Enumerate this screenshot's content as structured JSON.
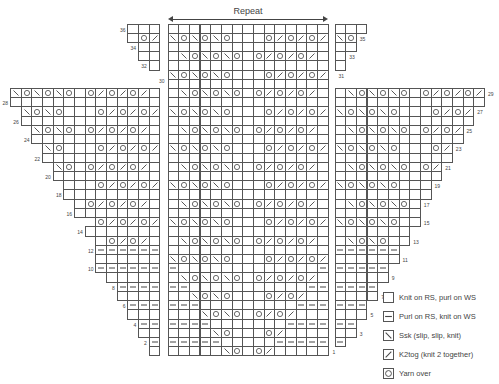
{
  "repeat": {
    "label": "Repeat"
  },
  "symbols_key": {
    ".": "knit",
    "-": "purl",
    "\\": "ssk",
    "/": "k2tog",
    "o": "yarn-over"
  },
  "center_chart": {
    "stitches": 15,
    "rows": [
      {
        "n": 36,
        "s": "..............."
      },
      {
        "n": 35,
        "s": "\\o\\o\\o...o/o/o/"
      },
      {
        "n": 34,
        "s": "..............."
      },
      {
        "n": 33,
        "s": ".\\o\\o\\o.o/o/o/."
      },
      {
        "n": 32,
        "s": "..............."
      },
      {
        "n": 31,
        "s": "\\o\\o\\o...o/o/o/"
      },
      {
        "n": 30,
        "s": "..............."
      },
      {
        "n": 29,
        "s": ".\\o\\o\\o.o/o/o/."
      },
      {
        "n": 28,
        "s": "..............."
      },
      {
        "n": 27,
        "s": "\\o\\o\\o...o/o/o/"
      },
      {
        "n": 26,
        "s": "..............."
      },
      {
        "n": 25,
        "s": ".\\o\\o\\o.o/o/o/."
      },
      {
        "n": 24,
        "s": "..............."
      },
      {
        "n": 23,
        "s": "\\o\\o\\o...o/o/o/"
      },
      {
        "n": 22,
        "s": "..............."
      },
      {
        "n": 21,
        "s": ".\\o\\o\\o.o/o/o/."
      },
      {
        "n": 20,
        "s": "..............."
      },
      {
        "n": 19,
        "s": "\\o\\o\\o...o/o/o/"
      },
      {
        "n": 18,
        "s": "..............."
      },
      {
        "n": 17,
        "s": ".\\o\\o\\o.o/o/o/."
      },
      {
        "n": 16,
        "s": "..............."
      },
      {
        "n": 15,
        "s": "\\o\\o\\o...o/o/o/"
      },
      {
        "n": 14,
        "s": "..............."
      },
      {
        "n": 13,
        "s": ".\\o\\o\\o.o/o/o/."
      },
      {
        "n": 12,
        "s": "..............."
      },
      {
        "n": 11,
        "s": "\\o\\o\\o...o/o/o/"
      },
      {
        "n": 10,
        "s": "-.............-"
      },
      {
        "n": 9,
        "s": ".\\o\\o\\o.o/o/o/."
      },
      {
        "n": 8,
        "s": "--...........--"
      },
      {
        "n": 7,
        "s": "..\\o\\o...o/o/.."
      },
      {
        "n": 6,
        "s": "---.........---"
      },
      {
        "n": 5,
        "s": "...\\o\\o.o/o/..."
      },
      {
        "n": 4,
        "s": "----.......----"
      },
      {
        "n": 3,
        "s": "....\\o...o/...."
      },
      {
        "n": 2,
        "s": "-----.....-----"
      },
      {
        "n": 1,
        "s": ".....\\o.o/....."
      }
    ],
    "labels": [
      {
        "n": 30,
        "side": "left"
      },
      {
        "n": 1,
        "side": "right"
      }
    ]
  },
  "left_chart": {
    "rows": [
      {
        "n": 36,
        "s": "...",
        "label": "36"
      },
      {
        "n": 35,
        "s": ".o/",
        "label": ""
      },
      {
        "n": 34,
        "s": "..",
        "label": "34"
      },
      {
        "n": 33,
        "s": "..",
        "label": ""
      },
      {
        "n": 32,
        "s": ".",
        "label": "32"
      },
      {
        "n": 29,
        "s": "\\o\\o\\o.o/o/o/.",
        "label": ""
      },
      {
        "n": 28,
        "s": "..............",
        "label": "28"
      },
      {
        "n": 27,
        "s": "\\o\\o...o/o/o/",
        "label": ""
      },
      {
        "n": 26,
        "s": ".............",
        "label": "26"
      },
      {
        "n": 25,
        "s": "\\o\\o.o/o/o/.",
        "label": ""
      },
      {
        "n": 24,
        "s": "............",
        "label": "24"
      },
      {
        "n": 23,
        "s": "\\o...o/o/o/",
        "label": ""
      },
      {
        "n": 22,
        "s": "...........",
        "label": "22"
      },
      {
        "n": 21,
        "s": "\\o.o/o/o/.",
        "label": ""
      },
      {
        "n": 20,
        "s": "..........",
        "label": "20"
      },
      {
        "n": 19,
        "s": "...o/o/o/",
        "label": ""
      },
      {
        "n": 18,
        "s": ".........",
        "label": "18"
      },
      {
        "n": 17,
        "s": ".o/o/o/.",
        "label": ""
      },
      {
        "n": 16,
        "s": "........",
        "label": "16"
      },
      {
        "n": 15,
        "s": "o/o/o/",
        "label": ""
      },
      {
        "n": 14,
        "s": ".......",
        "label": "14"
      },
      {
        "n": 13,
        "s": ".o/o/.",
        "label": ""
      },
      {
        "n": 12,
        "s": "------",
        "label": "12"
      },
      {
        "n": 11,
        "s": "......",
        "label": ""
      },
      {
        "n": 10,
        "s": "------",
        "label": "10"
      },
      {
        "n": 9,
        "s": ".....",
        "label": ""
      },
      {
        "n": 8,
        "s": "----",
        "label": "8"
      },
      {
        "n": 7,
        "s": "....",
        "label": ""
      },
      {
        "n": 6,
        "s": "---",
        "label": "6"
      },
      {
        "n": 5,
        "s": "...",
        "label": ""
      },
      {
        "n": 4,
        "s": "--",
        "label": "4"
      },
      {
        "n": 3,
        "s": "..",
        "label": ""
      },
      {
        "n": 2,
        "s": "-",
        "label": "2"
      },
      {
        "n": 1,
        "s": ".",
        "label": ""
      }
    ]
  },
  "right_chart": {
    "rows": [
      {
        "n": 36,
        "s": "...",
        "label": ""
      },
      {
        "n": 35,
        "s": "\\o",
        "label": "35"
      },
      {
        "n": 34,
        "s": "..",
        "label": ""
      },
      {
        "n": 33,
        "s": ".",
        "label": "33"
      },
      {
        "n": 32,
        "s": ".",
        "label": ""
      },
      {
        "n": 31,
        "s": "",
        "label": "31"
      },
      {
        "n": 29,
        "s": ".\\o\\o\\o.o/o/o/",
        "label": "29"
      },
      {
        "n": 28,
        "s": "..............",
        "label": ""
      },
      {
        "n": 27,
        "s": "\\o\\o\\o...o/o/",
        "label": "27"
      },
      {
        "n": 26,
        "s": ".............",
        "label": ""
      },
      {
        "n": 25,
        "s": ".\\o\\o\\o.o/o/",
        "label": "25"
      },
      {
        "n": 24,
        "s": "............",
        "label": ""
      },
      {
        "n": 23,
        "s": "\\o\\o\\o...o/",
        "label": "23"
      },
      {
        "n": 22,
        "s": "...........",
        "label": ""
      },
      {
        "n": 21,
        "s": ".\\o\\o\\o.o/",
        "label": "21"
      },
      {
        "n": 20,
        "s": "..........",
        "label": ""
      },
      {
        "n": 19,
        "s": "\\o\\o\\o...",
        "label": "19"
      },
      {
        "n": 18,
        "s": ".........",
        "label": ""
      },
      {
        "n": 17,
        "s": ".\\o\\o\\o.",
        "label": "17"
      },
      {
        "n": 16,
        "s": "........",
        "label": ""
      },
      {
        "n": 15,
        "s": "\\o\\o\\o..",
        "label": "15"
      },
      {
        "n": 14,
        "s": ".......",
        "label": ""
      },
      {
        "n": 13,
        "s": ".\\o\\o..",
        "label": "13"
      },
      {
        "n": 12,
        "s": "------",
        "label": ""
      },
      {
        "n": 11,
        "s": "......",
        "label": "11"
      },
      {
        "n": 10,
        "s": "-----",
        "label": ""
      },
      {
        "n": 9,
        "s": ".....",
        "label": "9"
      },
      {
        "n": 8,
        "s": "----",
        "label": ""
      },
      {
        "n": 7,
        "s": "....",
        "label": "7"
      },
      {
        "n": 6,
        "s": "---",
        "label": ""
      },
      {
        "n": 5,
        "s": "...",
        "label": "5"
      },
      {
        "n": 4,
        "s": "--",
        "label": ""
      },
      {
        "n": 3,
        "s": "..",
        "label": "3"
      },
      {
        "n": 2,
        "s": "-",
        "label": ""
      }
    ]
  },
  "legend": [
    {
      "symbol": ".",
      "label": "Knit on RS, purl on WS"
    },
    {
      "symbol": "-",
      "label": "Purl on RS, knit on WS"
    },
    {
      "symbol": "\\",
      "label": "Ssk (slip, slip, knit)"
    },
    {
      "symbol": "/",
      "label": "K2tog (knit 2 together)"
    },
    {
      "symbol": "o",
      "label": "Yarn over"
    }
  ]
}
